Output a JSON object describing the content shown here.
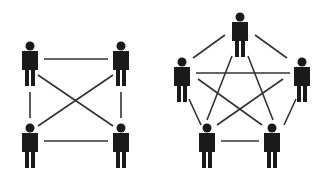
{
  "colors": {
    "background": "#ffffff",
    "figure": "#1a1a1a",
    "line": "#333333"
  },
  "diagrams": [
    {
      "name": "four-person-network",
      "nodes": [
        {
          "id": "a",
          "x": 30,
          "y": 46
        },
        {
          "id": "b",
          "x": 121,
          "y": 46
        },
        {
          "id": "c",
          "x": 30,
          "y": 128
        },
        {
          "id": "d",
          "x": 121,
          "y": 128
        }
      ],
      "edges": [
        {
          "from": [
            44,
            59
          ],
          "to": [
            108,
            59
          ]
        },
        {
          "from": [
            44,
            141
          ],
          "to": [
            108,
            141
          ]
        },
        {
          "from": [
            30,
            92
          ],
          "to": [
            30,
            118
          ]
        },
        {
          "from": [
            121,
            92
          ],
          "to": [
            121,
            118
          ]
        },
        {
          "from": [
            38,
            75
          ],
          "to": [
            113,
            126
          ]
        },
        {
          "from": [
            113,
            75
          ],
          "to": [
            38,
            126
          ]
        }
      ]
    },
    {
      "name": "five-person-network",
      "nodes": [
        {
          "id": "top",
          "x": 240,
          "y": 17
        },
        {
          "id": "left",
          "x": 182,
          "y": 62
        },
        {
          "id": "right",
          "x": 302,
          "y": 62
        },
        {
          "id": "bottom-left",
          "x": 207,
          "y": 128
        },
        {
          "id": "bottom-right",
          "x": 272,
          "y": 128
        }
      ],
      "edges": [
        {
          "from": [
            193,
            58
          ],
          "to": [
            225,
            35
          ]
        },
        {
          "from": [
            255,
            35
          ],
          "to": [
            287,
            58
          ]
        },
        {
          "from": [
            196,
            73
          ],
          "to": [
            290,
            73
          ]
        },
        {
          "from": [
            189,
            99
          ],
          "to": [
            201,
            125
          ]
        },
        {
          "from": [
            296,
            99
          ],
          "to": [
            284,
            125
          ]
        },
        {
          "from": [
            221,
            141
          ],
          "to": [
            259,
            141
          ]
        },
        {
          "from": [
            232,
            56
          ],
          "to": [
            207,
            120
          ]
        },
        {
          "from": [
            248,
            56
          ],
          "to": [
            273,
            120
          ]
        },
        {
          "from": [
            198,
            79
          ],
          "to": [
            262,
            125
          ]
        },
        {
          "from": [
            283,
            79
          ],
          "to": [
            217,
            125
          ]
        }
      ]
    }
  ]
}
